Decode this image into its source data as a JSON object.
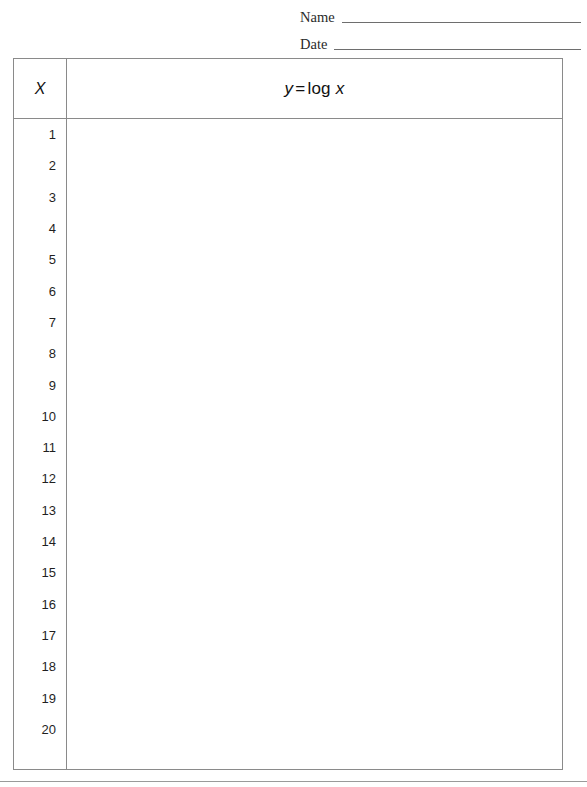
{
  "page": {
    "background_color": "#ffffff",
    "border_color": "#8a8a8a",
    "text_color": "#1c1c1c"
  },
  "header_fields": [
    {
      "label": "Name",
      "value": "",
      "placeholder": ""
    },
    {
      "label": "Date",
      "value": "",
      "placeholder": ""
    }
  ],
  "table": {
    "columns": [
      {
        "key": "x",
        "header": "X"
      },
      {
        "key": "y",
        "header_parts": {
          "lhs": "y",
          "operator": "=",
          "function": "log",
          "argument": "x"
        },
        "header": "y = log x"
      }
    ],
    "rows": [
      {
        "x": "1",
        "y": ""
      },
      {
        "x": "2",
        "y": ""
      },
      {
        "x": "3",
        "y": ""
      },
      {
        "x": "4",
        "y": ""
      },
      {
        "x": "5",
        "y": ""
      },
      {
        "x": "6",
        "y": ""
      },
      {
        "x": "7",
        "y": ""
      },
      {
        "x": "8",
        "y": ""
      },
      {
        "x": "9",
        "y": ""
      },
      {
        "x": "10",
        "y": ""
      },
      {
        "x": "11",
        "y": ""
      },
      {
        "x": "12",
        "y": ""
      },
      {
        "x": "13",
        "y": ""
      },
      {
        "x": "14",
        "y": ""
      },
      {
        "x": "15",
        "y": ""
      },
      {
        "x": "16",
        "y": ""
      },
      {
        "x": "17",
        "y": ""
      },
      {
        "x": "18",
        "y": ""
      },
      {
        "x": "19",
        "y": ""
      },
      {
        "x": "20",
        "y": ""
      }
    ]
  }
}
